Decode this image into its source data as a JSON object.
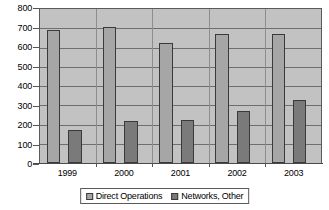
{
  "chart_data": {
    "type": "bar",
    "title": "",
    "subtitle": "",
    "xlabel": "",
    "ylabel": "",
    "categories": [
      "1999",
      "2000",
      "2001",
      "2002",
      "2003"
    ],
    "series": [
      {
        "name": "Direct Operations",
        "color": "#a6a6a6",
        "values": [
          690,
          705,
          622,
          672,
          672
        ]
      },
      {
        "name": "Networks, Other",
        "color": "#7a7a7a",
        "values": [
          170,
          220,
          222,
          268,
          325
        ]
      }
    ],
    "ylim": [
      0,
      800
    ],
    "ytick_step": 100,
    "yticks": [
      800,
      700,
      600,
      500,
      400,
      300,
      200,
      100,
      0
    ],
    "grid": true,
    "grid_axis": "y",
    "legend_position": "bottom",
    "plot_background": "#c2c2c2",
    "figure_background": "#ffffff"
  }
}
